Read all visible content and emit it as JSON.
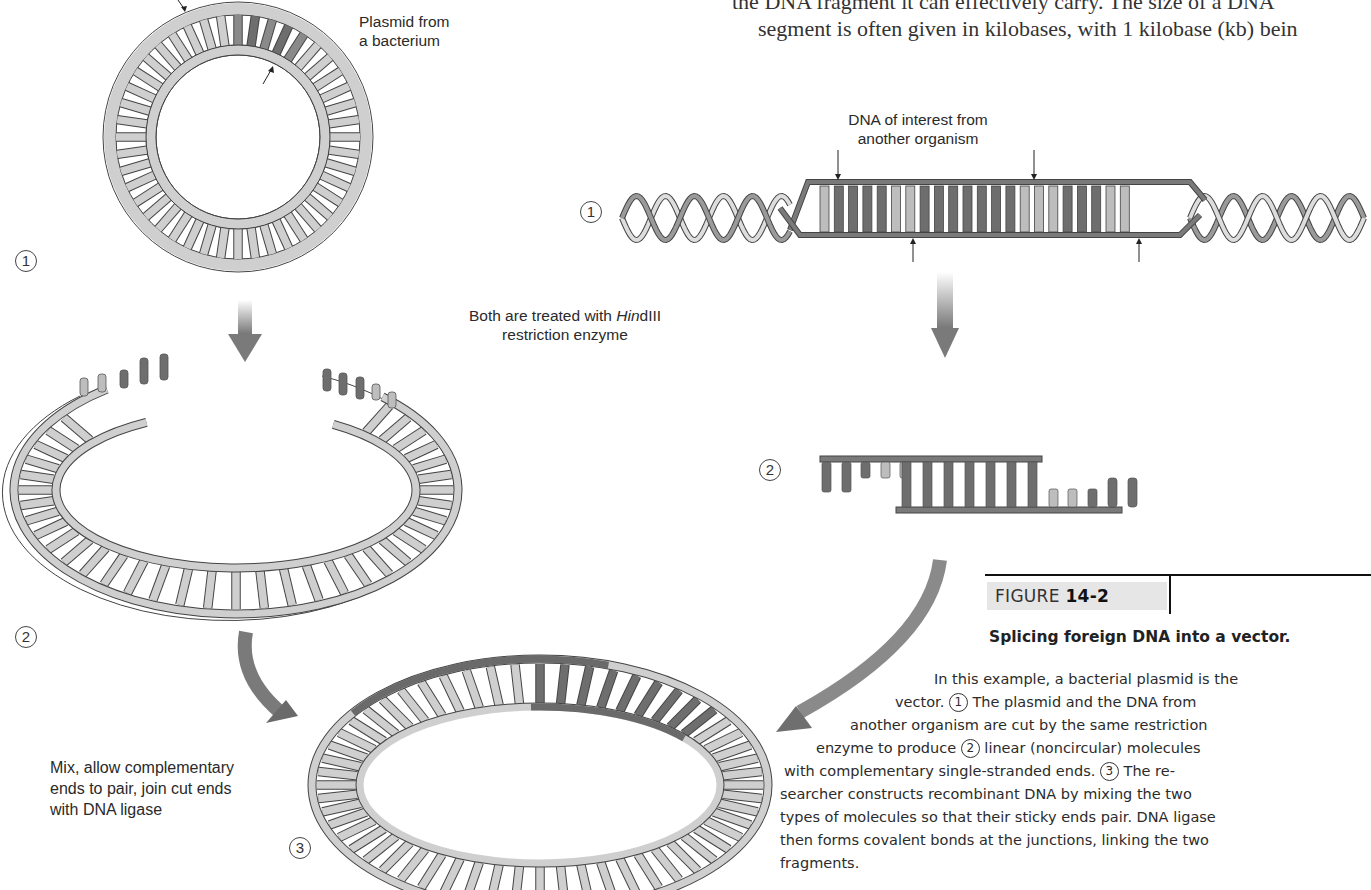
{
  "body_text": {
    "line1": "the DNA fragment it can effectively carry. The size of a DNA",
    "line2": "segment is often given in kilobases, with 1 kilobase (kb) bein"
  },
  "diagram": {
    "plasmid_label_line1": "Plasmid from",
    "plasmid_label_line2": "a bacterium",
    "dna_label_line1": "DNA of interest from",
    "dna_label_line2": "another organism",
    "treatment_label_prefix": "Both are treated with ",
    "treatment_label_italic": "Hin",
    "treatment_label_suffix": "dIII",
    "treatment_label_line2": "restriction enzyme",
    "mix_label_line1": "Mix, allow complementary",
    "mix_label_line2": "ends to pair, join cut ends",
    "mix_label_line3": "with DNA ligase",
    "steps": {
      "left_1": "1",
      "left_2": "2",
      "bottom_3": "3",
      "right_1": "1",
      "right_2": "2"
    },
    "colors": {
      "backbone_light": "#cfcfcf",
      "backbone_dark": "#7a7a7a",
      "base_dark": "#6e6e6e",
      "base_light": "#bdbdbd",
      "arrow": "#7c7c7c"
    }
  },
  "figure": {
    "tag_prefix": "FIGURE ",
    "tag_number": "14-2",
    "title": "Splicing foreign DNA into a vector.",
    "caption": {
      "l1": "In this example, a bacterial plasmid is the",
      "l2a": "vector. ",
      "l2s": "1",
      "l2b": " The plasmid and the DNA from",
      "l3": "another organism are cut by the same restriction",
      "l4a": "enzyme to produce ",
      "l4s": "2",
      "l4b": " linear (noncircular) molecules",
      "l5a": "with complementary single-stranded ends. ",
      "l5s": "3",
      "l5b": " The re-",
      "l6": "searcher constructs recombinant DNA by mixing the two",
      "l7": "types of molecules so that their sticky ends pair. DNA ligase",
      "l8": "then forms covalent bonds at the junctions, linking the two",
      "l9": "fragments."
    }
  }
}
